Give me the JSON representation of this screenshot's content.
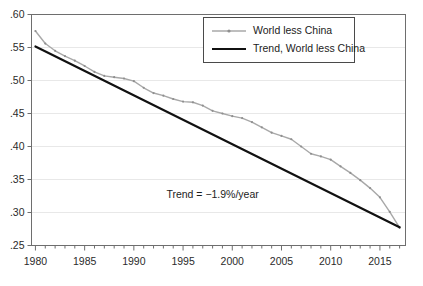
{
  "chart_data": {
    "type": "line",
    "title": "",
    "xlabel": "",
    "ylabel": "",
    "xlim": [
      1979.6,
      2017.6
    ],
    "ylim": [
      0.25,
      0.6
    ],
    "grid": true,
    "y_ticks": [
      0.25,
      0.3,
      0.35,
      0.4,
      0.45,
      0.5,
      0.55,
      0.6
    ],
    "y_tick_labels": [
      ".25",
      ".30",
      ".35",
      ".40",
      ".45",
      ".50",
      ".55",
      ".60"
    ],
    "x_ticks": [
      1980,
      1985,
      1990,
      1995,
      2000,
      2005,
      2010,
      2015
    ],
    "x_tick_labels": [
      "1980",
      "1985",
      "1990",
      "1995",
      "2000",
      "2005",
      "2010",
      "2015"
    ],
    "x_minor_tick_step": 1,
    "legend_position": "top-right",
    "annotations": [
      {
        "text": "Trend = −1.9%/year",
        "x": 1998.0,
        "y": 0.322
      }
    ],
    "series": [
      {
        "name": "World less China",
        "style": "line-with-markers",
        "color": "#a8a8a8",
        "x": [
          1980,
          1981,
          1982,
          1983,
          1984,
          1985,
          1986,
          1987,
          1988,
          1989,
          1990,
          1991,
          1992,
          1993,
          1994,
          1995,
          1996,
          1997,
          1998,
          1999,
          2000,
          2001,
          2002,
          2003,
          2004,
          2005,
          2006,
          2007,
          2008,
          2009,
          2010,
          2011,
          2012,
          2013,
          2014,
          2015,
          2016,
          2017
        ],
        "values": [
          0.575,
          0.556,
          0.545,
          0.537,
          0.53,
          0.522,
          0.513,
          0.507,
          0.505,
          0.503,
          0.499,
          0.489,
          0.481,
          0.477,
          0.472,
          0.468,
          0.467,
          0.462,
          0.454,
          0.45,
          0.446,
          0.443,
          0.437,
          0.429,
          0.421,
          0.416,
          0.411,
          0.4,
          0.389,
          0.385,
          0.38,
          0.37,
          0.36,
          0.349,
          0.337,
          0.323,
          0.301,
          0.277
        ]
      },
      {
        "name": "Trend, World less China",
        "style": "line",
        "color": "#111111",
        "x": [
          1980,
          2017
        ],
        "values": [
          0.5515,
          0.2775
        ]
      }
    ],
    "legend_entries": [
      {
        "label": "World less China",
        "color": "#a8a8a8",
        "marker": true
      },
      {
        "label": "Trend, World less China",
        "color": "#111111",
        "marker": false
      }
    ]
  },
  "axes": {
    "frame_color": "#6e6e6e",
    "grid_color": "#e8e8e8"
  }
}
